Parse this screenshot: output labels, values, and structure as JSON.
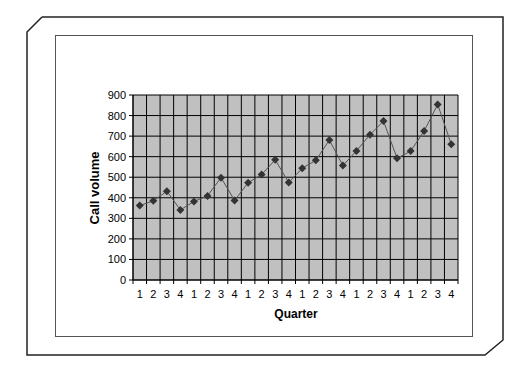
{
  "chart_data": {
    "type": "line",
    "title": "",
    "xlabel": "Quarter",
    "ylabel": "Call volume",
    "ylim": [
      0,
      900
    ],
    "yticks": [
      0,
      100,
      200,
      300,
      400,
      500,
      600,
      700,
      800,
      900
    ],
    "grid": true,
    "legend": null,
    "plot_background": "#c0c0c0",
    "marker": "diamond",
    "categories": [
      "1",
      "2",
      "3",
      "4",
      "1",
      "2",
      "3",
      "4",
      "1",
      "2",
      "3",
      "4",
      "1",
      "2",
      "3",
      "4",
      "1",
      "2",
      "3",
      "4",
      "1",
      "2",
      "3",
      "4"
    ],
    "series": [
      {
        "name": "Call volume",
        "color": "#333333",
        "values": [
          362,
          385,
          432,
          341,
          382,
          409,
          498,
          387,
          473,
          513,
          585,
          474,
          544,
          582,
          681,
          557,
          628,
          707,
          773,
          592,
          627,
          725,
          854,
          661
        ]
      }
    ]
  }
}
